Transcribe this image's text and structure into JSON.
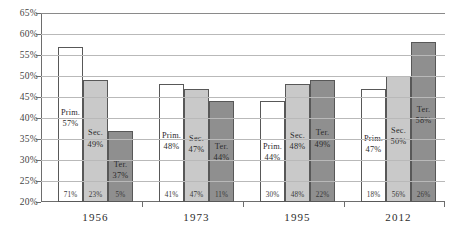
{
  "chart_data": {
    "type": "bar",
    "title": "",
    "subtitle": "",
    "xlabel": "",
    "ylabel": "",
    "ylim": [
      20,
      65
    ],
    "ytick_step": 5,
    "ytick_labels": [
      "65%",
      "60%",
      "55%",
      "50%",
      "45%",
      "40%",
      "35%",
      "30%",
      "25%",
      "20%"
    ],
    "ytick_values": [
      65,
      60,
      55,
      50,
      45,
      40,
      35,
      30,
      25,
      20
    ],
    "grid": true,
    "legend": "none",
    "categories": [
      "1956",
      "1973",
      "1995",
      "2012"
    ],
    "series": [
      {
        "name": "Prim.",
        "color": "#ffffff",
        "values": [
          57,
          48,
          44,
          47
        ],
        "value_labels": [
          "57%",
          "48%",
          "44%",
          "47%"
        ],
        "base_labels": [
          "71%",
          "41%",
          "30%",
          "18%"
        ]
      },
      {
        "name": "Sec.",
        "color": "#c9c9c9",
        "values": [
          49,
          47,
          48,
          50
        ],
        "value_labels": [
          "49%",
          "47%",
          "48%",
          "50%"
        ],
        "base_labels": [
          "23%",
          "47%",
          "48%",
          "56%"
        ]
      },
      {
        "name": "Ter.",
        "color": "#8f8f8f",
        "values": [
          37,
          44,
          49,
          58
        ],
        "value_labels": [
          "37%",
          "44%",
          "49%",
          "58%"
        ],
        "base_labels": [
          "5%",
          "11%",
          "22%",
          "26%"
        ]
      }
    ],
    "groups": [
      {
        "year": "1956",
        "bars": [
          {
            "level": "Prim.",
            "value_label": "57%",
            "base_label": "71%"
          },
          {
            "level": "Sec.",
            "value_label": "49%",
            "base_label": "23%"
          },
          {
            "level": "Ter.",
            "value_label": "37%",
            "base_label": "5%"
          }
        ]
      },
      {
        "year": "1973",
        "bars": [
          {
            "level": "Prim.",
            "value_label": "48%",
            "base_label": "41%"
          },
          {
            "level": "Sec.",
            "value_label": "47%",
            "base_label": "47%"
          },
          {
            "level": "Ter.",
            "value_label": "44%",
            "base_label": "11%"
          }
        ]
      },
      {
        "year": "1995",
        "bars": [
          {
            "level": "Prim.",
            "value_label": "44%",
            "base_label": "30%"
          },
          {
            "level": "Sec.",
            "value_label": "48%",
            "base_label": "48%"
          },
          {
            "level": "Ter.",
            "value_label": "49%",
            "base_label": "22%"
          }
        ]
      },
      {
        "year": "2012",
        "bars": [
          {
            "level": "Prim.",
            "value_label": "47%",
            "base_label": "18%"
          },
          {
            "level": "Sec.",
            "value_label": "50%",
            "base_label": "56%"
          },
          {
            "level": "Ter.",
            "value_label": "58%",
            "base_label": "26%"
          }
        ]
      }
    ]
  }
}
